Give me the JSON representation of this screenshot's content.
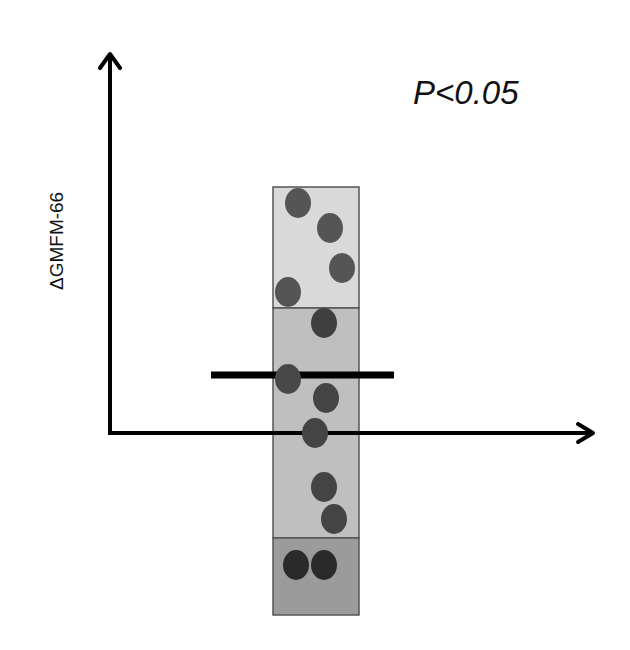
{
  "chart_data": {
    "type": "scatter",
    "title": "",
    "xlabel": "",
    "ylabel": "ΔGMFM-66",
    "annotation": "P<0.05",
    "grid": false,
    "legend": null,
    "axes": {
      "origin_px": [
        110,
        433
      ],
      "x_axis_end_px": 595,
      "y_axis_top_px": 52
    },
    "bands": [
      {
        "name": "upper",
        "y_top_px": 187,
        "y_bottom_px": 308,
        "color": "#d9d9d9"
      },
      {
        "name": "middle",
        "y_top_px": 308,
        "y_bottom_px": 538,
        "color": "#bfbfbf"
      },
      {
        "name": "lower",
        "y_top_px": 538,
        "y_bottom_px": 615,
        "color": "#9b9b9b"
      }
    ],
    "box_x_px": [
      273,
      359
    ],
    "mean_line": {
      "y_px": 375,
      "x_from_px": 211,
      "x_to_px": 394
    },
    "points_px": [
      {
        "x": 298,
        "y": 203,
        "color": "#555555"
      },
      {
        "x": 330,
        "y": 228,
        "color": "#555555"
      },
      {
        "x": 342,
        "y": 268,
        "color": "#555555"
      },
      {
        "x": 288,
        "y": 292,
        "color": "#555555"
      },
      {
        "x": 324,
        "y": 323,
        "color": "#3f3f3f"
      },
      {
        "x": 288,
        "y": 379,
        "color": "#484848"
      },
      {
        "x": 326,
        "y": 398,
        "color": "#444444"
      },
      {
        "x": 315,
        "y": 433,
        "color": "#444444"
      },
      {
        "x": 324,
        "y": 487,
        "color": "#444444"
      },
      {
        "x": 334,
        "y": 519,
        "color": "#444444"
      },
      {
        "x": 296,
        "y": 565,
        "color": "#2a2a2a"
      },
      {
        "x": 324,
        "y": 565,
        "color": "#2a2a2a"
      }
    ],
    "relative_values_from_zero": [
      11.5,
      9.5,
      7.5,
      6.0,
      5.0,
      2.5,
      1.5,
      0.0,
      -2.5,
      -4.0,
      -6.5,
      -6.5
    ]
  },
  "labels": {
    "ylabel": "ΔGMFM-66",
    "pvalue": "P<0.05"
  }
}
